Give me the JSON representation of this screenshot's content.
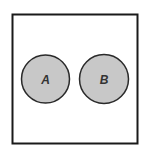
{
  "diagram": {
    "type": "venn",
    "universe": {
      "label": ""
    },
    "sets": [
      {
        "id": "A",
        "label": "A",
        "fill": "#c8c8c8",
        "stroke": "#2a2a2a"
      },
      {
        "id": "B",
        "label": "B",
        "fill": "#c8c8c8",
        "stroke": "#2a2a2a"
      }
    ],
    "relationship": "disjoint",
    "colors": {
      "background": "#ffffff",
      "border": "#1a1a1a",
      "set_fill": "#c8c8c8"
    }
  }
}
